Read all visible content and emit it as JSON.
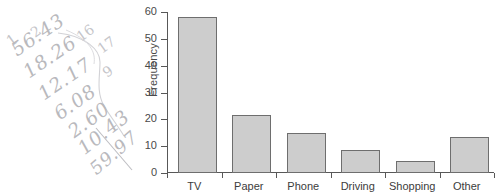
{
  "handwriting": {
    "lines": [
      "56.43",
      "18.26",
      "12.17",
      "6.08",
      "2.60",
      "10.43",
      "59.97"
    ],
    "marks": [
      "1",
      "2",
      "16",
      "17",
      "9"
    ],
    "color": "#b9b9bd"
  },
  "chart_data": {
    "type": "bar",
    "title": "",
    "xlabel": "",
    "ylabel": "Frequency",
    "categories": [
      "TV",
      "Paper",
      "Phone",
      "Driving",
      "Shopping",
      "Other"
    ],
    "values": [
      58,
      21.5,
      15,
      8.5,
      4.5,
      13.5
    ],
    "ylim": [
      0,
      60
    ],
    "yticks": [
      0,
      10,
      20,
      30,
      40,
      50,
      60
    ],
    "ytick_labels": [
      "0",
      "10",
      "20",
      "30",
      "40",
      "50",
      "60"
    ],
    "grid": false,
    "legend": false,
    "bar_fill": "#cdcdcd",
    "bar_edge": "#6e6e6e",
    "axis_color": "#585858"
  }
}
